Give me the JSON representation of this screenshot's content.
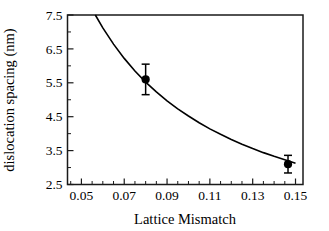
{
  "chart_data": {
    "type": "scatter",
    "title": "",
    "xlabel": "Lattice Mismatch",
    "ylabel": "dislocation spacing (nm)",
    "xlim": [
      0.0435,
      0.1535
    ],
    "ylim": [
      2.5,
      7.5
    ],
    "grid": false,
    "legend": "none",
    "x_major_ticks": [
      0.05,
      0.07,
      0.09,
      0.11,
      0.13,
      0.15
    ],
    "x_major_tick_labels": [
      "0.05",
      "0.07",
      "0.09",
      "0.11",
      "0.13",
      "0.15"
    ],
    "x_minor_tick_step": 0.005,
    "y_major_ticks": [
      2.5,
      3.5,
      4.5,
      5.5,
      6.5,
      7.5
    ],
    "y_major_tick_labels": [
      "2.5",
      "3.5",
      "4.5",
      "5.5",
      "6.5",
      "7.5"
    ],
    "y_minor_tick_step": 0.5,
    "series": [
      {
        "name": "measured dislocation spacing",
        "type": "scatter",
        "marker": "filled-circle",
        "color": "#000000",
        "points": [
          {
            "x": 0.08,
            "y": 5.6,
            "yerr": 0.45
          },
          {
            "x": 0.1465,
            "y": 3.1,
            "yerr": 0.26
          }
        ]
      },
      {
        "name": "fitted curve",
        "type": "line",
        "color": "#000000",
        "points": [
          {
            "x": 0.0565,
            "y": 7.5
          },
          {
            "x": 0.06,
            "y": 7.12
          },
          {
            "x": 0.065,
            "y": 6.64
          },
          {
            "x": 0.07,
            "y": 6.22
          },
          {
            "x": 0.075,
            "y": 5.85
          },
          {
            "x": 0.08,
            "y": 5.52
          },
          {
            "x": 0.085,
            "y": 5.23
          },
          {
            "x": 0.09,
            "y": 4.97
          },
          {
            "x": 0.095,
            "y": 4.73
          },
          {
            "x": 0.1,
            "y": 4.52
          },
          {
            "x": 0.105,
            "y": 4.32
          },
          {
            "x": 0.11,
            "y": 4.14
          },
          {
            "x": 0.115,
            "y": 3.98
          },
          {
            "x": 0.12,
            "y": 3.83
          },
          {
            "x": 0.125,
            "y": 3.69
          },
          {
            "x": 0.13,
            "y": 3.56
          },
          {
            "x": 0.135,
            "y": 3.44
          },
          {
            "x": 0.14,
            "y": 3.33
          },
          {
            "x": 0.145,
            "y": 3.23
          },
          {
            "x": 0.15,
            "y": 3.13
          }
        ]
      }
    ]
  }
}
